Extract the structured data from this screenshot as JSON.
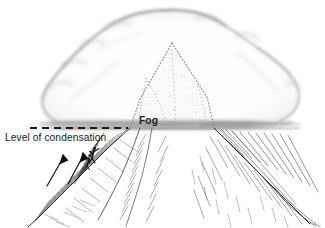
{
  "figure": {
    "medium": "pen-and-ink hatched illustration",
    "background_color": "#ffffff",
    "ink_color": "#1c1c1c",
    "cloud_color": "#9a9a9a",
    "width": 325,
    "height": 228
  },
  "labels": {
    "condensation": "Level of condensation",
    "fog": "Fog"
  },
  "annotations": {
    "condensation_line": {
      "name": "level-of-condensation-dashed-line",
      "style": "dashed",
      "y": 128,
      "x_start": 30,
      "x_end": 128
    },
    "arrows": [
      {
        "name": "rising-air-arrow-left",
        "x1": 47,
        "y1": 185,
        "x2": 63,
        "y2": 157
      },
      {
        "name": "rising-air-arrow-right",
        "x1": 68,
        "y1": 183,
        "x2": 82,
        "y2": 155
      }
    ],
    "climber": {
      "name": "climber-figure",
      "x": 92,
      "y": 152
    }
  },
  "elements": {
    "cloud": "cumulus cloud cap enveloping the summit",
    "peak": "mountain summit inside the cloud, rendered in stipple",
    "fog_band": "horizontal grey fog layer at the condensation level",
    "left_slope": "hatched left flank of the mountain below the fog",
    "right_slope": "hatched right flank of the mountain below the fog"
  }
}
